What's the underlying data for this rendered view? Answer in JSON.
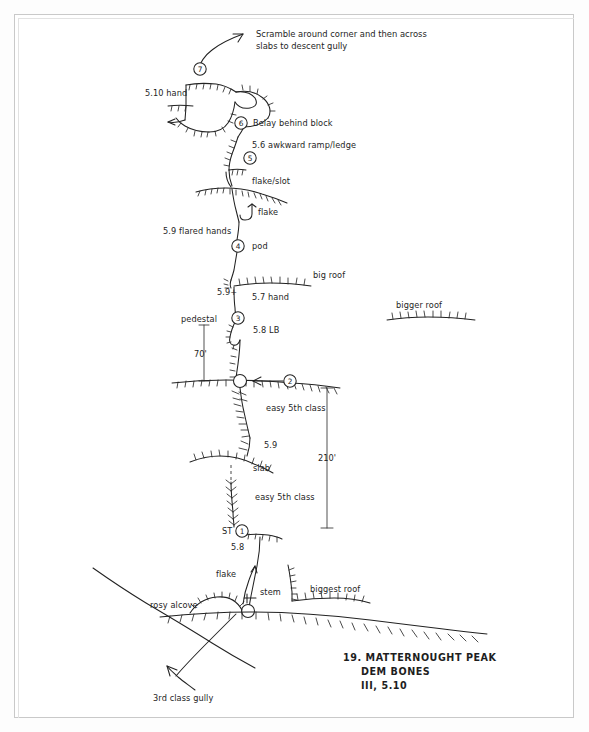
{
  "document": {
    "type": "climbing-route-topo",
    "title_block": {
      "number_and_peak": "19.  MATTERNOUGHT PEAK",
      "route_name": "DEM BONES",
      "grade": "III, 5.10"
    }
  },
  "notes": {
    "descent_line1": "Scramble around corner and then across",
    "descent_line2": "slabs to descent gully",
    "third_class_gully": "3rd class gully"
  },
  "pitch_markers": [
    {
      "id": "1",
      "number": "1",
      "label": "ST"
    },
    {
      "id": "2",
      "number": "2",
      "label": ""
    },
    {
      "id": "3",
      "number": "3",
      "label": ""
    },
    {
      "id": "4",
      "number": "4",
      "label": "pod"
    },
    {
      "id": "5",
      "number": "5",
      "label": ""
    },
    {
      "id": "6",
      "number": "6",
      "label": "Belay behind block"
    },
    {
      "id": "7",
      "number": "7",
      "label": ""
    }
  ],
  "grade_labels": [
    {
      "id": "g-510-hand",
      "text": "5.10  hand"
    },
    {
      "id": "g-56-ramp",
      "text": "5.6  awkward ramp/ledge"
    },
    {
      "id": "g-59-flared",
      "text": "5.9  flared hands"
    },
    {
      "id": "g-59plus",
      "text": "5.9+"
    },
    {
      "id": "g-57-hand",
      "text": "5.7  hand"
    },
    {
      "id": "g-58-lb",
      "text": "5.8 LB"
    },
    {
      "id": "g-easy-5th-upper",
      "text": "easy 5th class"
    },
    {
      "id": "g-59",
      "text": "5.9"
    },
    {
      "id": "g-easy-5th-lower",
      "text": "easy 5th class"
    },
    {
      "id": "g-58",
      "text": "5.8"
    }
  ],
  "feature_labels": [
    {
      "id": "f-belay-block",
      "text": "Belay behind block"
    },
    {
      "id": "f-flake-slot",
      "text": "flake/slot"
    },
    {
      "id": "f-flake-upper",
      "text": "flake"
    },
    {
      "id": "f-pod",
      "text": "pod"
    },
    {
      "id": "f-big-roof",
      "text": "big roof"
    },
    {
      "id": "f-bigger-roof",
      "text": "bigger roof"
    },
    {
      "id": "f-pedestal",
      "text": "pedestal"
    },
    {
      "id": "f-slab",
      "text": "slab"
    },
    {
      "id": "f-st",
      "text": "ST"
    },
    {
      "id": "f-flake-lower",
      "text": "flake"
    },
    {
      "id": "f-stem",
      "text": "stem"
    },
    {
      "id": "f-biggest-roof",
      "text": "biggest roof"
    },
    {
      "id": "f-rosy-alcove",
      "text": "rosy alcove"
    }
  ],
  "dimensions": [
    {
      "id": "d-70",
      "text": "70'"
    },
    {
      "id": "d-210",
      "text": "210'"
    }
  ],
  "colors": {
    "ink": "#222222",
    "paper": "#ffffff",
    "frame": "#c9c9c9"
  }
}
